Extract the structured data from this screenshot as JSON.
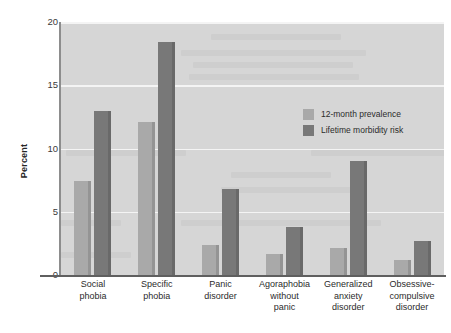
{
  "chart_data": {
    "type": "bar",
    "title": "",
    "subtitle": "",
    "xlabel": "",
    "ylabel": "Percent",
    "ylim": [
      0,
      20
    ],
    "yticks": [
      0,
      5,
      10,
      15,
      20
    ],
    "ytick_labels": [
      "0",
      "5",
      "10",
      "15",
      "20"
    ],
    "grid": true,
    "grid_axis": "y",
    "legend_position": "upper right (inside plot)",
    "categories": [
      "Social phobia",
      "Specific phobia",
      "Panic disorder",
      "Agoraphobia without panic",
      "Generalized anxiety disorder",
      "Obsessive-compulsive disorder"
    ],
    "category_lines": [
      [
        "Social",
        "phobia"
      ],
      [
        "Specific",
        "phobia"
      ],
      [
        "Panic",
        "disorder"
      ],
      [
        "Agoraphobia",
        "without",
        "panic"
      ],
      [
        "Generalized",
        "anxiety",
        "disorder"
      ],
      [
        "Obsessive-",
        "compulsive",
        "disorder"
      ]
    ],
    "series": [
      {
        "name": "12-month prevalence",
        "color": "#a9a9a9",
        "values": [
          7.4,
          12.1,
          2.4,
          1.7,
          2.1,
          1.2
        ]
      },
      {
        "name": "Lifetime morbidity risk",
        "color": "#787878",
        "values": [
          13.0,
          18.4,
          6.8,
          3.8,
          9.0,
          2.7
        ]
      }
    ]
  },
  "colors": {
    "plot_background": "#d6d6d6",
    "gridline": "#f4f4f4",
    "axis": "#5f5f5f",
    "light_bar": "#a9a9a9",
    "dark_bar": "#787878",
    "text": "#2b2b2b",
    "page_background": "#ffffff"
  }
}
